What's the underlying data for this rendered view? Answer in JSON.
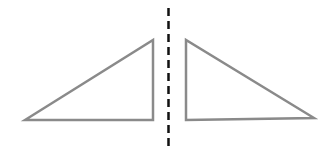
{
  "diagram": {
    "shapes": [
      {
        "name": "left-triangle",
        "kind": "right-triangle",
        "orientation": "right-angle-bottom-right"
      },
      {
        "name": "right-triangle",
        "kind": "right-triangle",
        "orientation": "right-angle-bottom-left"
      }
    ],
    "axis": {
      "name": "line-of-symmetry",
      "style": "dashed",
      "orientation": "vertical"
    },
    "colors": {
      "triangle_stroke": "#8a8a8a",
      "axis_stroke": "#111111",
      "background": "#ffffff"
    }
  }
}
